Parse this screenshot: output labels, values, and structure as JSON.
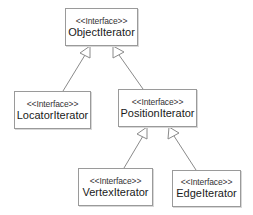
{
  "diagram": {
    "type": "uml-class-hierarchy",
    "colors": {
      "border": "#9a9a9a",
      "line": "#8a8a8a",
      "text": "#222222",
      "background": "#ffffff"
    },
    "nodes": [
      {
        "id": "ObjectIterator",
        "stereotype": "<<Interface>>",
        "name": "ObjectIterator"
      },
      {
        "id": "LocatorIterator",
        "stereotype": "<<Interface>>",
        "name": "LocatorIterator"
      },
      {
        "id": "PositionIterator",
        "stereotype": "<<Interface>>",
        "name": "PositionIterator"
      },
      {
        "id": "VertexIterator",
        "stereotype": "<<Interface>>",
        "name": "VertexIterator"
      },
      {
        "id": "EdgeIterator",
        "stereotype": "<<Interface>>",
        "name": "EdgeIterator"
      }
    ],
    "edges": [
      {
        "from": "LocatorIterator",
        "to": "ObjectIterator",
        "kind": "generalization"
      },
      {
        "from": "PositionIterator",
        "to": "ObjectIterator",
        "kind": "generalization"
      },
      {
        "from": "VertexIterator",
        "to": "PositionIterator",
        "kind": "generalization"
      },
      {
        "from": "EdgeIterator",
        "to": "PositionIterator",
        "kind": "generalization"
      }
    ]
  }
}
